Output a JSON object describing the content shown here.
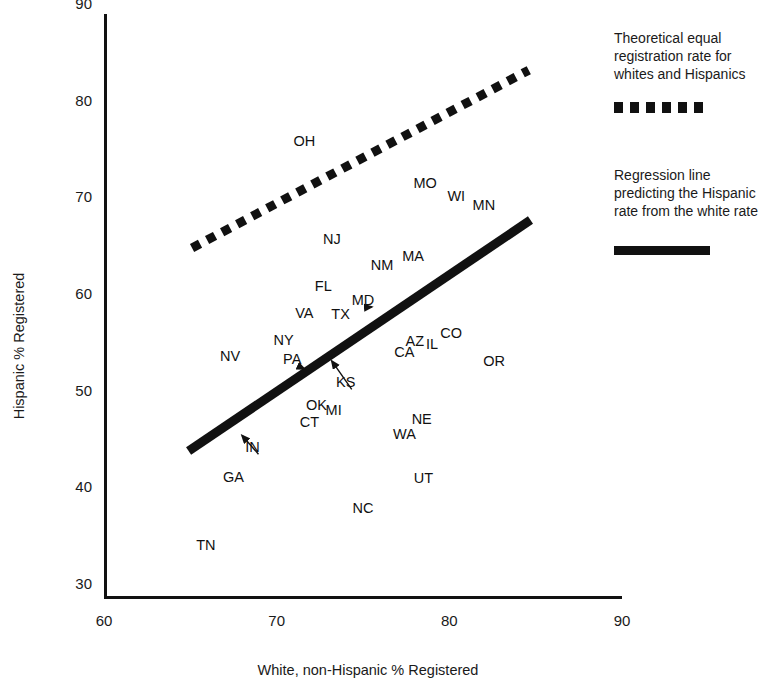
{
  "chart_data": {
    "type": "scatter",
    "title": "",
    "xlabel": "White, non-Hispanic % Registered",
    "ylabel": "Hispanic % Registered",
    "xlim": [
      60,
      90
    ],
    "ylim": [
      30,
      90
    ],
    "xticks": [
      60,
      70,
      80,
      90
    ],
    "yticks": [
      30,
      40,
      50,
      60,
      70,
      80,
      90
    ],
    "grid": false,
    "legend_position": "right",
    "point_marker": "text-label",
    "points": [
      {
        "label": "OH",
        "x": 71.6,
        "y": 77.2
      },
      {
        "label": "MO",
        "x": 78.6,
        "y": 72.8
      },
      {
        "label": "WI",
        "x": 80.4,
        "y": 71.5
      },
      {
        "label": "MN",
        "x": 82.0,
        "y": 70.6
      },
      {
        "label": "NJ",
        "x": 73.2,
        "y": 67.0
      },
      {
        "label": "MA",
        "x": 77.9,
        "y": 65.3
      },
      {
        "label": "NM",
        "x": 76.1,
        "y": 64.3
      },
      {
        "label": "FL",
        "x": 72.7,
        "y": 62.2
      },
      {
        "label": "MD",
        "x": 75.0,
        "y": 60.7
      },
      {
        "label": "VA",
        "x": 71.6,
        "y": 59.4
      },
      {
        "label": "TX",
        "x": 73.7,
        "y": 59.3
      },
      {
        "label": "CO",
        "x": 80.1,
        "y": 57.3
      },
      {
        "label": "AZ",
        "x": 78.0,
        "y": 56.5
      },
      {
        "label": "IL",
        "x": 79.0,
        "y": 56.2
      },
      {
        "label": "NY",
        "x": 70.4,
        "y": 56.6
      },
      {
        "label": "CA",
        "x": 77.4,
        "y": 55.3
      },
      {
        "label": "PA",
        "x": 70.9,
        "y": 54.6
      },
      {
        "label": "NV",
        "x": 67.3,
        "y": 54.9
      },
      {
        "label": "OR",
        "x": 82.6,
        "y": 54.4
      },
      {
        "label": "KS",
        "x": 74.0,
        "y": 52.2
      },
      {
        "label": "OK",
        "x": 72.3,
        "y": 49.9
      },
      {
        "label": "MI",
        "x": 73.3,
        "y": 49.3
      },
      {
        "label": "CT",
        "x": 71.9,
        "y": 48.1
      },
      {
        "label": "NE",
        "x": 78.4,
        "y": 48.4
      },
      {
        "label": "WA",
        "x": 77.4,
        "y": 46.9
      },
      {
        "label": "IN",
        "x": 68.6,
        "y": 45.5
      },
      {
        "label": "GA",
        "x": 67.5,
        "y": 42.4
      },
      {
        "label": "UT",
        "x": 78.5,
        "y": 42.3
      },
      {
        "label": "NC",
        "x": 75.0,
        "y": 39.2
      },
      {
        "label": "TN",
        "x": 65.9,
        "y": 35.4
      }
    ],
    "lines": [
      {
        "name": "theoretical-equal-rate-line",
        "style": "dotted",
        "x": [
          65.1,
          84.6
        ],
        "y": [
          66.1,
          84.5
        ]
      },
      {
        "name": "regression-line",
        "style": "solid",
        "x": [
          64.9,
          84.7
        ],
        "y": [
          45.1,
          69.0
        ]
      }
    ],
    "annotation_arrows": [
      {
        "from_label": "MD",
        "to_x": 75.5,
        "to_y": 60.0
      },
      {
        "from_label": "PA",
        "to_x": 71.6,
        "to_y": 53.6
      },
      {
        "from_label": "KS",
        "to_x": 73.2,
        "to_y": 54.4
      },
      {
        "from_label": "IN",
        "to_x": 68.0,
        "to_y": 46.7
      }
    ]
  },
  "axes": {
    "x_tick_labels": [
      "60",
      "70",
      "80",
      "90"
    ],
    "y_tick_labels": [
      "90",
      "80",
      "70",
      "60",
      "50",
      "40",
      "30"
    ],
    "x_title": "White, non-Hispanic % Registered",
    "y_title": "Hispanic % Registered"
  },
  "legend": {
    "entries": [
      {
        "text": "Theoretical equal registration rate for whites and Hispanics",
        "style": "dotted",
        "color": "#111111"
      },
      {
        "text": "Regression line predicting the Hispanic rate from the white rate",
        "style": "solid",
        "color": "#111111"
      }
    ]
  }
}
